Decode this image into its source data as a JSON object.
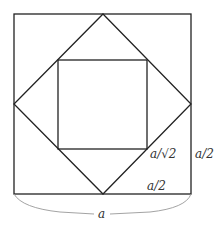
{
  "diagram": {
    "labels": {
      "diamond_side": "a/√2",
      "right_half": "a/2",
      "bottom_half": "a/2",
      "full_side": "a"
    },
    "colors": {
      "stroke": "#222222",
      "brace": "#999999",
      "text": "#333333"
    }
  }
}
